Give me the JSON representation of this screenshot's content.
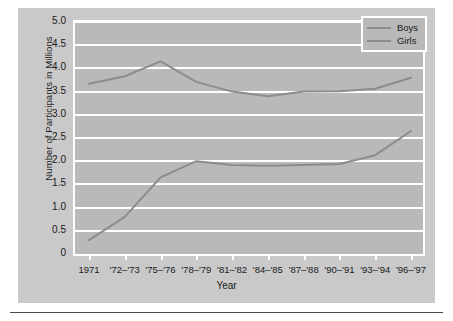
{
  "chart_data": {
    "type": "line",
    "title": "",
    "xlabel": "Year",
    "ylabel": "Number of Participants in Millions",
    "ylim": [
      0,
      5.0
    ],
    "yticks": [
      "0",
      "0.5",
      "1.0",
      "1.5",
      "2.0",
      "2.5",
      "3.0",
      "3.5",
      "4.0",
      "4.5",
      "5.0"
    ],
    "ytick_values": [
      0,
      0.5,
      1.0,
      1.5,
      2.0,
      2.5,
      3.0,
      3.5,
      4.0,
      4.5,
      5.0
    ],
    "grid": true,
    "legend_position": "top-right",
    "categories": [
      "1971",
      "'72–'73",
      "'75–'76",
      "'78–'79",
      "'81–'82",
      "'84–'85",
      "'87–'88",
      "'90–'91",
      "'93–'94",
      "'96–'97"
    ],
    "series": [
      {
        "name": "Boys",
        "color": "#8c8c8c",
        "values": [
          3.67,
          3.83,
          4.15,
          3.71,
          3.5,
          3.4,
          3.5,
          3.51,
          3.56,
          3.8
        ]
      },
      {
        "name": "Girls",
        "color": "#8c8c8c",
        "values": [
          0.3,
          0.8,
          1.65,
          2.0,
          1.92,
          1.9,
          1.92,
          1.94,
          2.13,
          2.65
        ]
      }
    ]
  },
  "legend": {
    "entries": [
      {
        "label": "Boys"
      },
      {
        "label": "Girls"
      }
    ]
  },
  "colors": {
    "figure_background": "#c9c9c9",
    "plot_background": "#b9b9b9",
    "gridline": "#ffffff",
    "line": "#8c8c8c",
    "text": "#1a1a1a",
    "rule": "#4a4a4a"
  }
}
